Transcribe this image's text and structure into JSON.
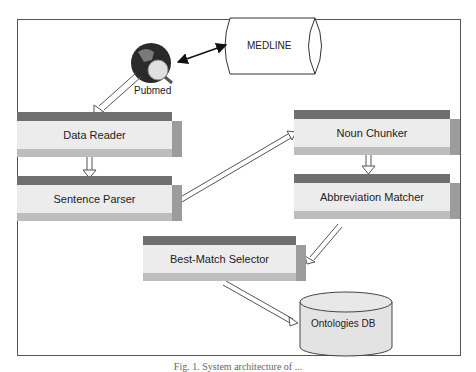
{
  "diagram": {
    "nodes": {
      "medline": "MEDLINE",
      "pubmed": "Pubmed",
      "data_reader": "Data Reader",
      "sentence_parser": "Sentence Parser",
      "noun_chunker": "Noun Chunker",
      "abbreviation_matcher": "Abbreviation Matcher",
      "best_match_selector": "Best-Match Selector",
      "ontologies_db": "Ontologies DB"
    },
    "edges": [
      {
        "from": "Pubmed",
        "to": "MEDLINE",
        "type": "bidirectional"
      },
      {
        "from": "Pubmed",
        "to": "Data Reader"
      },
      {
        "from": "Data Reader",
        "to": "Sentence Parser"
      },
      {
        "from": "Sentence Parser",
        "to": "Noun Chunker"
      },
      {
        "from": "Noun Chunker",
        "to": "Abbreviation Matcher"
      },
      {
        "from": "Abbreviation Matcher",
        "to": "Best-Match Selector"
      },
      {
        "from": "Best-Match Selector",
        "to": "Ontologies DB"
      }
    ],
    "caption": "Fig. 1. System architecture of ..."
  }
}
